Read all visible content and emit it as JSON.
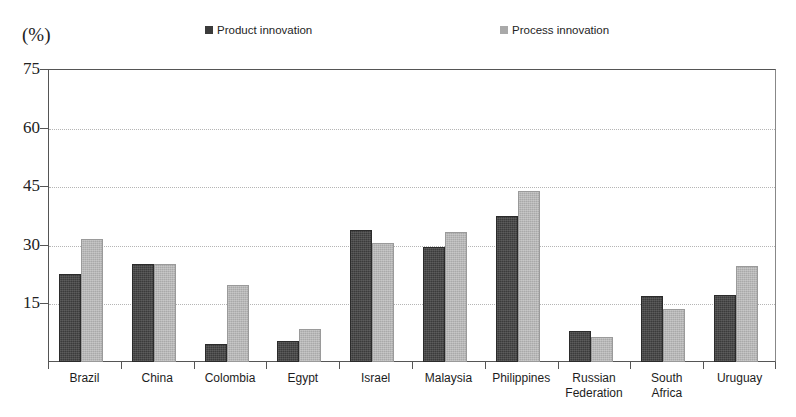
{
  "axis": {
    "unit_label": "(%)",
    "y_ticks": [
      "75",
      "60",
      "45",
      "30",
      "15"
    ],
    "y_tick_values": [
      75,
      60,
      45,
      30,
      15
    ]
  },
  "legend": {
    "entries": [
      {
        "label": "Product innovation",
        "color": "#3b3b3b",
        "key": "product"
      },
      {
        "label": "Process innovation",
        "color": "#a9a9a9",
        "key": "process"
      }
    ]
  },
  "chart_data": {
    "type": "bar",
    "title": "",
    "subtitle": "",
    "xlabel": "",
    "ylabel": "(%)",
    "ylim": [
      0,
      75
    ],
    "ytick_step": 15,
    "grid": true,
    "legend_position": "top",
    "categories": [
      "Brazil",
      "China",
      "Colombia",
      "Egypt",
      "Israel",
      "Malaysia",
      "Philippines",
      "Russian Federation",
      "South Africa",
      "Uruguay"
    ],
    "category_lines": [
      [
        "Brazil"
      ],
      [
        "China"
      ],
      [
        "Colombia"
      ],
      [
        "Egypt"
      ],
      [
        "Israel"
      ],
      [
        "Malaysia"
      ],
      [
        "Philippines"
      ],
      [
        "Russian",
        "Federation"
      ],
      [
        "South",
        "Africa"
      ],
      [
        "Uruguay"
      ]
    ],
    "series": [
      {
        "name": "Product innovation",
        "color": "#3b3b3b",
        "values": [
          22.5,
          25.0,
          4.5,
          5.5,
          33.8,
          29.5,
          37.5,
          8.0,
          17.0,
          17.2
        ]
      },
      {
        "name": "Process innovation",
        "color": "#a9a9a9",
        "values": [
          31.5,
          25.2,
          19.8,
          8.5,
          30.5,
          33.2,
          43.8,
          6.3,
          13.5,
          24.5
        ]
      }
    ]
  }
}
